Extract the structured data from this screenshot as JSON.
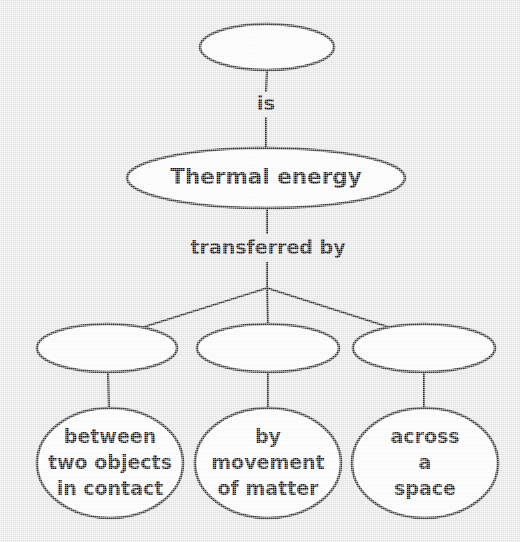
{
  "diagram": {
    "type": "concept-map",
    "background_color": "#e9e9e9",
    "node_fill": "#ffffff",
    "node_stroke": "#3b3b3b",
    "text_color": "#111111",
    "nodes": [
      {
        "id": "root",
        "label": "",
        "shape": "ellipse",
        "cx": 267,
        "cy": 47,
        "rx": 67,
        "ry": 23,
        "lines": []
      },
      {
        "id": "thermal-energy",
        "label": "Thermal energy",
        "shape": "ellipse",
        "cx": 266,
        "cy": 178,
        "rx": 139,
        "ry": 30,
        "lines": [
          "Thermal energy"
        ]
      },
      {
        "id": "branch-left",
        "label": "",
        "shape": "ellipse",
        "cx": 107,
        "cy": 348,
        "rx": 70,
        "ry": 24,
        "lines": []
      },
      {
        "id": "branch-middle",
        "label": "",
        "shape": "ellipse",
        "cx": 268,
        "cy": 348,
        "rx": 71,
        "ry": 24,
        "lines": []
      },
      {
        "id": "branch-right",
        "label": "",
        "shape": "ellipse",
        "cx": 424,
        "cy": 348,
        "rx": 71,
        "ry": 24,
        "lines": []
      },
      {
        "id": "leaf-conduction",
        "label": "between two objects in contact",
        "shape": "ellipse",
        "cx": 110,
        "cy": 463,
        "rx": 73,
        "ry": 55,
        "lines": [
          "between",
          "two objects",
          "in contact"
        ]
      },
      {
        "id": "leaf-convection",
        "label": "by movement of matter",
        "shape": "ellipse",
        "cx": 268,
        "cy": 463,
        "rx": 73,
        "ry": 55,
        "lines": [
          "by",
          "movement",
          "of matter"
        ]
      },
      {
        "id": "leaf-radiation",
        "label": "across a space",
        "shape": "ellipse",
        "cx": 425,
        "cy": 463,
        "rx": 73,
        "ry": 55,
        "lines": [
          "across",
          "a",
          "space"
        ]
      }
    ],
    "link_labels": [
      {
        "id": "link-is",
        "text": "is",
        "x": 266,
        "y": 104
      },
      {
        "id": "link-transferred-by",
        "text": "transferred by",
        "x": 268,
        "y": 248
      }
    ],
    "connectors": [
      {
        "id": "root-to-is",
        "from": "root",
        "to": "link-is",
        "x1": 267,
        "y1": 70,
        "x2": 266,
        "y2": 92
      },
      {
        "id": "is-to-thermal-energy",
        "from": "link-is",
        "to": "thermal-energy",
        "x1": 266,
        "y1": 117,
        "x2": 266,
        "y2": 148
      },
      {
        "id": "thermal-energy-to-transferred-by",
        "from": "thermal-energy",
        "to": "link-transferred-by",
        "x1": 267,
        "y1": 208,
        "x2": 267,
        "y2": 234
      },
      {
        "id": "transferred-by-to-junction",
        "from": "link-transferred-by",
        "to": "junction",
        "x1": 267,
        "y1": 262,
        "x2": 267,
        "y2": 288
      },
      {
        "id": "junction-to-branch-left",
        "from": "junction",
        "to": "branch-left",
        "x1": 267,
        "y1": 288,
        "x2": 131,
        "y2": 331
      },
      {
        "id": "junction-to-branch-middle",
        "from": "junction",
        "to": "branch-middle",
        "x1": 267,
        "y1": 288,
        "x2": 268,
        "y2": 325
      },
      {
        "id": "junction-to-branch-right",
        "from": "junction",
        "to": "branch-right",
        "x1": 267,
        "y1": 288,
        "x2": 401,
        "y2": 331
      },
      {
        "id": "branch-left-to-leaf",
        "from": "branch-left",
        "to": "leaf-conduction",
        "x1": 108,
        "y1": 372,
        "x2": 109,
        "y2": 409
      },
      {
        "id": "branch-middle-to-leaf",
        "from": "branch-middle",
        "to": "leaf-convection",
        "x1": 268,
        "y1": 372,
        "x2": 268,
        "y2": 409
      },
      {
        "id": "branch-right-to-leaf",
        "from": "branch-right",
        "to": "leaf-radiation",
        "x1": 424,
        "y1": 372,
        "x2": 424,
        "y2": 409
      }
    ]
  }
}
